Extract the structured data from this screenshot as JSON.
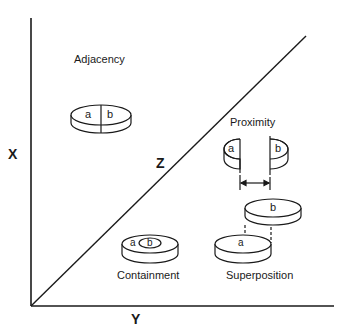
{
  "axes": {
    "x_label": "X",
    "y_label": "Y",
    "z_label": "Z"
  },
  "relations": {
    "adjacency": {
      "title": "Adjacency",
      "a": "a",
      "b": "b"
    },
    "proximity": {
      "title": "Proximity",
      "a": "a",
      "b": "b"
    },
    "containment": {
      "title": "Containment",
      "a": "a",
      "b": "b"
    },
    "superposition": {
      "title": "Superposition",
      "a": "a",
      "b": "b"
    }
  }
}
